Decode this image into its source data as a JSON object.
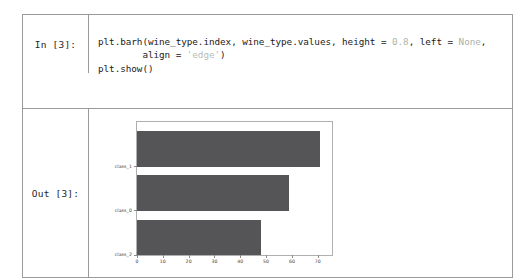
{
  "notebook": {
    "input_cell": {
      "prompt": "In [3]:",
      "code": {
        "line1_a": "plt.barh(wine_type.index, wine_type.values, height = ",
        "line1_num": "0.8",
        "line1_b": ", left = ",
        "line1_none": "None",
        "line1_c": ",",
        "line2_a": "        align = ",
        "line2_str": "'edge'",
        "line2_b": ")",
        "line3": "plt.show()"
      }
    },
    "output_cell": {
      "prompt": "Out [3]:"
    }
  },
  "chart_data": {
    "type": "bar",
    "orientation": "horizontal",
    "title": "",
    "xlabel": "",
    "ylabel": "",
    "categories": [
      "class_2",
      "class_0",
      "class_1"
    ],
    "values": [
      48,
      59,
      71
    ],
    "xticks": [
      "0",
      "10",
      "20",
      "30",
      "40",
      "50",
      "60",
      "70"
    ],
    "xtick_values": [
      0,
      10,
      20,
      30,
      40,
      50,
      60,
      70
    ],
    "xlim": [
      0,
      75.5
    ],
    "ylim": [
      0,
      3
    ],
    "bar_align": "edge",
    "bar_height": 0.8,
    "grid": false,
    "legend": false,
    "bar_color": "#555557",
    "frame_color": "#b0b0b0"
  }
}
